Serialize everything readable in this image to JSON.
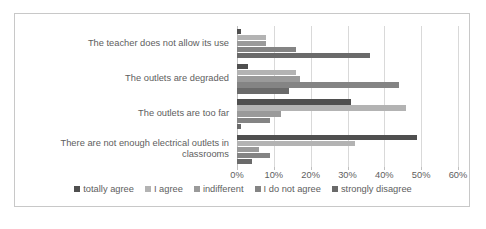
{
  "chart_data": {
    "type": "bar",
    "orientation": "horizontal",
    "title": "",
    "xlabel": "",
    "ylabel": "",
    "xlim": [
      0,
      60
    ],
    "xtick_labels": [
      "0%",
      "10%",
      "20%",
      "30%",
      "40%",
      "50%",
      "60%"
    ],
    "xticks": [
      0,
      10,
      20,
      30,
      40,
      50,
      60
    ],
    "grid": true,
    "legend_position": "bottom",
    "categories": [
      "The teacher does not allow its use",
      "The outlets are degraded",
      "The outlets are too far",
      "There are not enough electrical outlets in classrooms"
    ],
    "series": [
      {
        "name": "totally agree",
        "color": "#4f4f4f",
        "values": [
          1,
          3,
          31,
          49
        ]
      },
      {
        "name": "I agree",
        "color": "#b3b3b3",
        "values": [
          8,
          16,
          46,
          32
        ]
      },
      {
        "name": "indifferent",
        "color": "#9a9a9a",
        "values": [
          8,
          17,
          12,
          6
        ]
      },
      {
        "name": "I do not agree",
        "color": "#848484",
        "values": [
          16,
          44,
          9,
          9
        ]
      },
      {
        "name": "strongly disagree",
        "color": "#6a6a6a",
        "values": [
          36,
          14,
          1,
          4
        ]
      }
    ]
  },
  "style": {
    "frame_border": "#c8c8c8",
    "gridline": "#d9d9d9",
    "axis": "#bfbfbf",
    "text": "#5e5e5e",
    "background": "#ffffff"
  }
}
